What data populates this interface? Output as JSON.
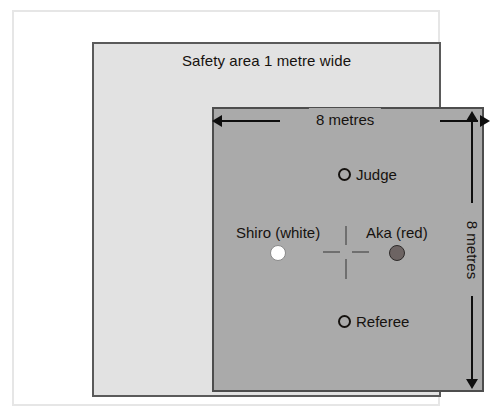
{
  "diagram": {
    "safety_area": {
      "label": "Safety area 1 metre wide",
      "fill_color": "#e2e2e2",
      "border_color": "#5a5a5a"
    },
    "competition_area": {
      "fill_color": "#aaaaaa",
      "border_color": "#4d4d4d"
    },
    "dimensions": {
      "width_label": "8 metres",
      "height_label": "8 metres",
      "arrow_color": "#0e0e0e"
    },
    "markers": [
      {
        "id": "judge",
        "label": "Judge",
        "marker_type": "open-circle",
        "marker_color": "#15120f"
      },
      {
        "id": "shiro",
        "label": "Shiro (white)",
        "marker_type": "filled-circle",
        "marker_color": "#ffffff"
      },
      {
        "id": "aka",
        "label": "Aka (red)",
        "marker_type": "filled-circle",
        "marker_color": "#6d6463"
      },
      {
        "id": "referee",
        "label": "Referee",
        "marker_type": "open-circle",
        "marker_color": "#15120f"
      }
    ],
    "centre_mark": {
      "style": "dashed-cross",
      "color": "#6f6f6f"
    }
  }
}
